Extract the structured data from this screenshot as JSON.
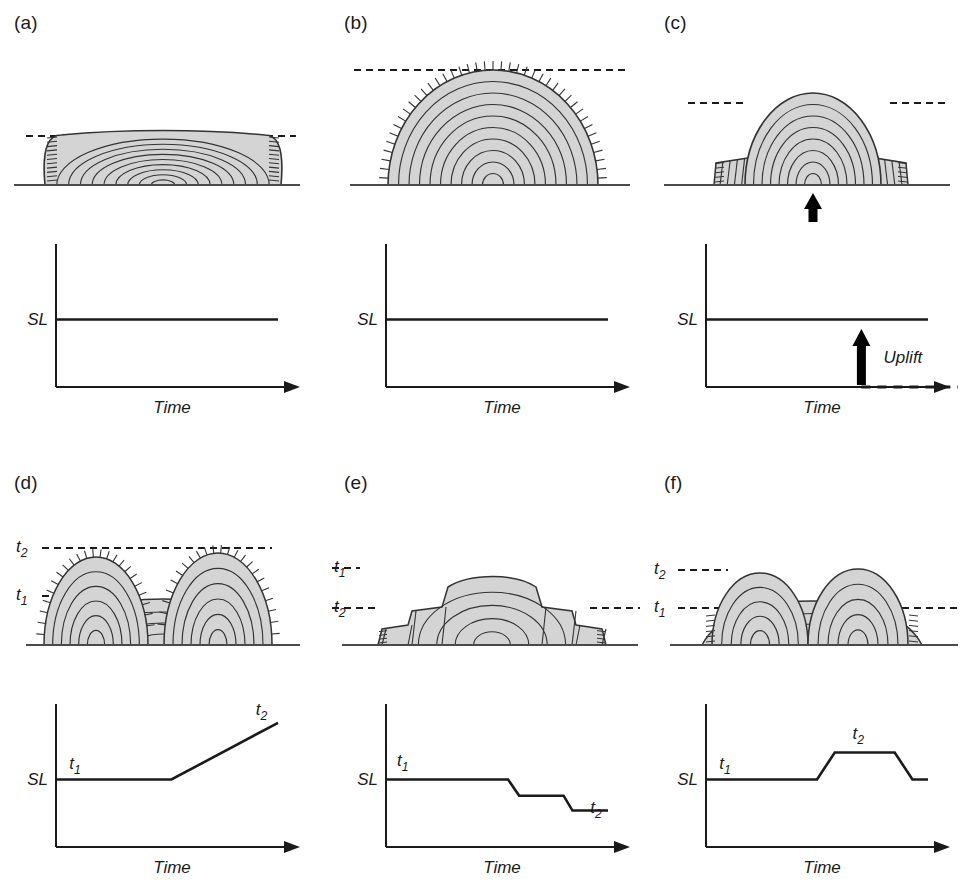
{
  "figure": {
    "colors": {
      "fill": "#d4d4d4",
      "line": "#333333",
      "axis": "#1a1a1a",
      "arrow": "#000000",
      "background": "#ffffff"
    }
  },
  "panels": [
    {
      "id": "a",
      "label": "(a)",
      "section": {
        "name": "flat-topped-aggrading-platform",
        "sealevel_lines": [
          {
            "name": "sea-level",
            "label": ""
          }
        ]
      },
      "chart_data": {
        "type": "line",
        "title": "",
        "xlabel": "Time",
        "ylabel": "SL",
        "y_axis_label": "SL",
        "x_axis_label": "Time",
        "axis_arrow": true,
        "x": [
          0,
          100
        ],
        "y": [
          50,
          50
        ],
        "ylim": [
          0,
          100
        ],
        "xlim": [
          0,
          100
        ],
        "grid": false,
        "annotations": [],
        "description": "Stable sea level"
      }
    },
    {
      "id": "b",
      "label": "(b)",
      "section": {
        "name": "domed-mound-build-up",
        "sealevel_lines": [
          {
            "name": "sea-level",
            "label": ""
          }
        ]
      },
      "chart_data": {
        "type": "line",
        "title": "",
        "xlabel": "Time",
        "ylabel": "SL",
        "y_axis_label": "SL",
        "x_axis_label": "Time",
        "axis_arrow": true,
        "x": [
          0,
          100
        ],
        "y": [
          50,
          50
        ],
        "ylim": [
          0,
          100
        ],
        "xlim": [
          0,
          100
        ],
        "grid": false,
        "annotations": [],
        "description": "Stable sea level"
      }
    },
    {
      "id": "c",
      "label": "(c)",
      "section": {
        "name": "uplifted-central-dome",
        "sealevel_lines": [
          {
            "name": "sea-level",
            "label": ""
          }
        ],
        "uplift_arrow": true
      },
      "chart_data": {
        "type": "line",
        "title": "",
        "xlabel": "Time",
        "ylabel": "SL",
        "y_axis_label": "SL",
        "x_axis_label": "Time",
        "axis_arrow": true,
        "x": [
          0,
          100
        ],
        "y": [
          50,
          50
        ],
        "ylim": [
          0,
          100
        ],
        "xlim": [
          0,
          100
        ],
        "grid": false,
        "annotations": [
          {
            "name": "uplift-label",
            "text": "Uplift",
            "x": 80,
            "y": 18
          }
        ],
        "description": "Stable sea level with tectonic uplift"
      }
    },
    {
      "id": "d",
      "label": "(d)",
      "section": {
        "name": "backstepping-twin-peaks",
        "sealevel_lines": [
          {
            "name": "t2-line",
            "label": "t₂",
            "base": "t",
            "sub": "2"
          },
          {
            "name": "t1-line",
            "label": "t₁",
            "base": "t",
            "sub": "1"
          }
        ]
      },
      "chart_data": {
        "type": "line",
        "title": "",
        "xlabel": "Time",
        "ylabel": "SL",
        "y_axis_label": "SL",
        "x_axis_label": "Time",
        "axis_arrow": true,
        "x": [
          0,
          52,
          100
        ],
        "y": [
          50,
          50,
          92
        ],
        "ylim": [
          0,
          100
        ],
        "xlim": [
          0,
          100
        ],
        "grid": false,
        "annotations": [
          {
            "name": "t1-label",
            "text": "t₁",
            "base": "t",
            "sub": "1",
            "x": 6,
            "y": 58
          },
          {
            "name": "t2-label",
            "text": "t₂",
            "base": "t",
            "sub": "2",
            "x": 90,
            "y": 98
          }
        ],
        "description": "Sea-level rise from t1 to t2"
      }
    },
    {
      "id": "e",
      "label": "(e)",
      "section": {
        "name": "offlapping-stepped-platform",
        "sealevel_lines": [
          {
            "name": "t1-line",
            "label": "t₁",
            "base": "t",
            "sub": "1"
          },
          {
            "name": "t2-line",
            "label": "t₂",
            "base": "t",
            "sub": "2"
          }
        ]
      },
      "chart_data": {
        "type": "line",
        "title": "",
        "xlabel": "Time",
        "ylabel": "SL",
        "y_axis_label": "SL",
        "x_axis_label": "Time",
        "axis_arrow": true,
        "x": [
          0,
          55,
          60,
          80,
          84,
          100
        ],
        "y": [
          50,
          50,
          38,
          38,
          27,
          27
        ],
        "ylim": [
          0,
          100
        ],
        "xlim": [
          0,
          100
        ],
        "grid": false,
        "annotations": [
          {
            "name": "t1-label",
            "text": "t₁",
            "base": "t",
            "sub": "1",
            "x": 5,
            "y": 60
          },
          {
            "name": "t2-label",
            "text": "t₂",
            "base": "t",
            "sub": "2",
            "x": 92,
            "y": 25
          }
        ],
        "description": "Stepped sea-level fall from t1 to t2"
      }
    },
    {
      "id": "f",
      "label": "(f)",
      "section": {
        "name": "rise-and-fall-twin-mounds",
        "sealevel_lines": [
          {
            "name": "t2-line",
            "label": "t₂",
            "base": "t",
            "sub": "2"
          },
          {
            "name": "t1-line",
            "label": "t₁",
            "base": "t",
            "sub": "1"
          }
        ]
      },
      "chart_data": {
        "type": "line",
        "title": "",
        "xlabel": "Time",
        "ylabel": "SL",
        "y_axis_label": "SL",
        "x_axis_label": "Time",
        "axis_arrow": true,
        "x": [
          0,
          50,
          58,
          85,
          93,
          100
        ],
        "y": [
          50,
          50,
          70,
          70,
          50,
          50
        ],
        "ylim": [
          0,
          100
        ],
        "xlim": [
          0,
          100
        ],
        "grid": false,
        "annotations": [
          {
            "name": "t1-label",
            "text": "t₁",
            "base": "t",
            "sub": "1",
            "x": 6,
            "y": 58
          },
          {
            "name": "t2-label",
            "text": "t₂",
            "base": "t",
            "sub": "2",
            "x": 66,
            "y": 80
          }
        ],
        "description": "Sea-level rise to plateau at t2 then fall"
      }
    }
  ]
}
